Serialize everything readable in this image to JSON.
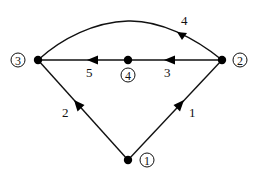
{
  "diagram": {
    "type": "directed-graph",
    "nodes": [
      {
        "id": "1",
        "label": "1",
        "x": 128,
        "y": 160,
        "label_x": 147,
        "label_y": 160
      },
      {
        "id": "2",
        "label": "2",
        "x": 222,
        "y": 60,
        "label_x": 240,
        "label_y": 60
      },
      {
        "id": "3",
        "label": "3",
        "x": 38,
        "y": 60,
        "label_x": 18,
        "label_y": 60
      },
      {
        "id": "4",
        "label": "4",
        "x": 128,
        "y": 60,
        "label_x": 128,
        "label_y": 75
      }
    ],
    "edges": [
      {
        "id": "e1",
        "label": "1",
        "from": "1",
        "to": "2",
        "shape": "straight"
      },
      {
        "id": "e2",
        "label": "2",
        "from": "1",
        "to": "3",
        "shape": "straight"
      },
      {
        "id": "e3",
        "label": "3",
        "from": "2",
        "to": "4",
        "shape": "straight"
      },
      {
        "id": "e4",
        "label": "4",
        "from": "2",
        "to": "3",
        "shape": "curved"
      },
      {
        "id": "e5",
        "label": "5",
        "from": "4",
        "to": "3",
        "shape": "straight"
      }
    ],
    "colors": {
      "stroke": "#111111",
      "background": "#ffffff"
    }
  }
}
